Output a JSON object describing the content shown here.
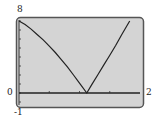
{
  "chart_data": {
    "type": "line",
    "title": "",
    "xlabel": "",
    "ylabel": "",
    "xlim": [
      0,
      2
    ],
    "ylim": [
      -1,
      8
    ],
    "grid": false,
    "tick_labels": {
      "ymax": "8",
      "ymin": "-1",
      "xmin": "0",
      "xmax": "2"
    },
    "series": [
      {
        "name": "f(x)",
        "x": [
          0,
          0.1,
          0.2,
          0.3,
          0.4,
          0.5,
          0.6,
          0.7,
          0.8,
          0.9,
          1.0,
          1.12,
          1.2,
          1.3,
          1.4,
          1.5,
          1.6,
          1.7,
          1.83
        ],
        "y": [
          8.0,
          7.6,
          7.1,
          6.5,
          5.9,
          5.2,
          4.5,
          3.7,
          2.9,
          2.0,
          1.1,
          0.0,
          0.9,
          2.0,
          3.1,
          4.2,
          5.3,
          6.5,
          8.0
        ]
      }
    ]
  },
  "colors": {
    "screen": "#d4d4d4",
    "frame": "#555555",
    "curve": "#222222"
  }
}
